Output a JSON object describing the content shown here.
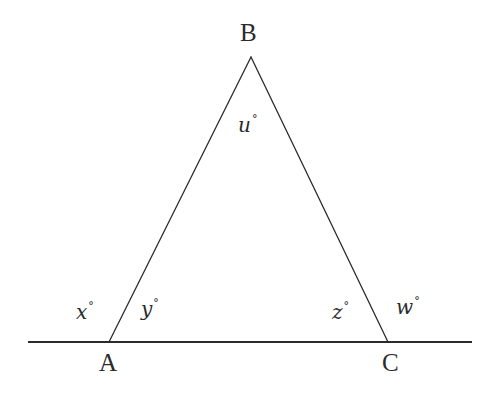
{
  "figure": {
    "type": "geometry-diagram",
    "background_color": "#ffffff",
    "stroke_color": "#2b2b2b",
    "vertices": [
      {
        "name": "B",
        "label": "B",
        "x": 251,
        "y": 57,
        "label_x": 240,
        "label_y": 20
      },
      {
        "name": "A",
        "label": "A",
        "x": 109,
        "y": 342,
        "label_x": 99,
        "label_y": 350
      },
      {
        "name": "C",
        "label": "C",
        "x": 388,
        "y": 342,
        "label_x": 382,
        "label_y": 350
      }
    ],
    "baseline": {
      "name": "horizontal-line",
      "x1": 28,
      "y1": 342,
      "x2": 472,
      "y2": 342
    },
    "sides": [
      {
        "name": "side-AB",
        "from": "A",
        "to": "B"
      },
      {
        "name": "side-BC",
        "from": "B",
        "to": "C"
      }
    ],
    "angle_labels": [
      {
        "name": "angle-u",
        "text": "u",
        "degree": "°",
        "at_vertex": "B",
        "kind": "interior",
        "x": 238,
        "y": 115
      },
      {
        "name": "angle-x",
        "text": "x",
        "degree": "°",
        "at_vertex": "A",
        "kind": "exterior",
        "x": 76,
        "y": 302
      },
      {
        "name": "angle-y",
        "text": "y",
        "degree": "°",
        "at_vertex": "A",
        "kind": "interior",
        "x": 141,
        "y": 299
      },
      {
        "name": "angle-z",
        "text": "z",
        "degree": "°",
        "at_vertex": "C",
        "kind": "interior",
        "x": 332,
        "y": 302
      },
      {
        "name": "angle-w",
        "text": "w",
        "degree": "°",
        "at_vertex": "C",
        "kind": "exterior",
        "x": 396,
        "y": 297
      }
    ]
  }
}
